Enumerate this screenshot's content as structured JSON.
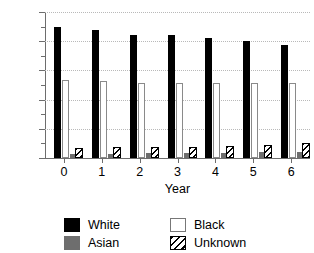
{
  "chart_data": {
    "type": "bar",
    "title": "",
    "xlabel": "Year",
    "ylabel": "",
    "categories": [
      "0",
      "1",
      "2",
      "3",
      "4",
      "5",
      "6"
    ],
    "ylim": [
      0,
      25000
    ],
    "ytick_labels": [
      "0",
      "5000",
      "10000",
      "15000",
      "20000",
      "25000"
    ],
    "ytick_values": [
      0,
      5000,
      10000,
      15000,
      20000,
      25000
    ],
    "ytick_minor_step": 2500,
    "grid": true,
    "grid_axis": "y",
    "legend_position": "bottom",
    "series": [
      {
        "name": "White",
        "color": "#000000",
        "style": "solid",
        "values": [
          22500,
          22000,
          21000,
          21000,
          20500,
          20000,
          19300
        ]
      },
      {
        "name": "Black",
        "color": "#ffffff",
        "style": "open",
        "values": [
          13400,
          13200,
          12900,
          12900,
          12900,
          12900,
          12900
        ]
      },
      {
        "name": "Asian",
        "color": "#6e6e6e",
        "style": "solid",
        "values": [
          700,
          750,
          800,
          850,
          900,
          950,
          1000
        ]
      },
      {
        "name": "Unknown",
        "color": "#000000",
        "style": "hatch",
        "values": [
          1800,
          1850,
          1900,
          1950,
          2000,
          2150,
          2500
        ]
      }
    ]
  },
  "legend": {
    "entries": [
      {
        "label": "White",
        "swatch": "solid-black-swatch"
      },
      {
        "label": "Black",
        "swatch": "open-white-swatch"
      },
      {
        "label": "Asian",
        "swatch": "solid-gray-swatch"
      },
      {
        "label": "Unknown",
        "swatch": "hatched-swatch"
      }
    ]
  }
}
